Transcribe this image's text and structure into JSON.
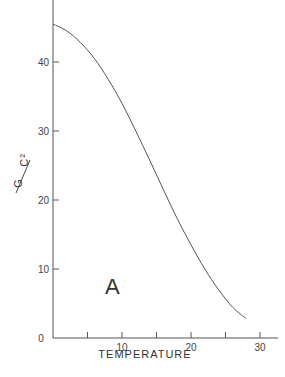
{
  "chart_data": {
    "type": "line",
    "title": "",
    "xlabel": "TEMPERATURE",
    "ylabel": "G/C²",
    "annotation": "A",
    "xlim": [
      0,
      32
    ],
    "ylim": [
      0,
      48
    ],
    "x_ticks": [
      0,
      5,
      10,
      15,
      20,
      25,
      30
    ],
    "x_tick_labels": [
      "0",
      "",
      "10",
      "",
      "20",
      "",
      "30"
    ],
    "y_ticks": [
      10,
      20,
      30,
      40
    ],
    "y_tick_labels": [
      "10",
      "20",
      "30",
      "40"
    ],
    "grid": false,
    "series": [
      {
        "name": "A",
        "x": [
          0,
          2,
          4,
          6,
          8,
          10,
          12,
          14,
          16,
          18,
          20,
          22,
          24,
          26,
          28
        ],
        "y": [
          45.5,
          44.5,
          42.8,
          40.5,
          37.5,
          34,
          30,
          25.8,
          21.5,
          17.3,
          13.5,
          10,
          7,
          4.5,
          2.8
        ]
      }
    ]
  }
}
